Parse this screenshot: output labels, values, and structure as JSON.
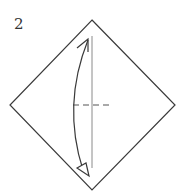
{
  "diagram": {
    "step_number": "2",
    "type": "origami-fold-instruction",
    "shape": "square-paper-diamond",
    "fold_line": "vertical-center-crease",
    "marks": [
      "vertical-crease-line",
      "horizontal-dashed-valley-mark",
      "curved-fold-arrow-top-to-bottom"
    ],
    "colors": {
      "line": "#3a3a3a",
      "crease": "#8a8a8a",
      "background": "#ffffff"
    }
  }
}
